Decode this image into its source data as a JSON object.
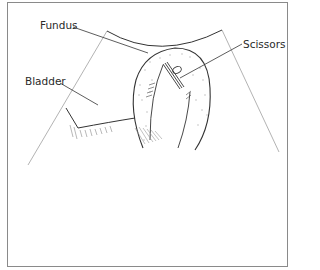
{
  "diagram": {
    "type": "anatomical line illustration",
    "labels": [
      {
        "id": "fundus",
        "text": "Fundus",
        "x": 40,
        "y": 20
      },
      {
        "id": "bladder",
        "text": "Bladder",
        "x": 25,
        "y": 76
      },
      {
        "id": "scissors",
        "text": "Scissors",
        "x": 243,
        "y": 39
      }
    ],
    "colors": {
      "line": "#333333",
      "guide": "#9a9a9a",
      "frame": "#8a8a8a",
      "stipple": "#b0b0b0"
    }
  }
}
